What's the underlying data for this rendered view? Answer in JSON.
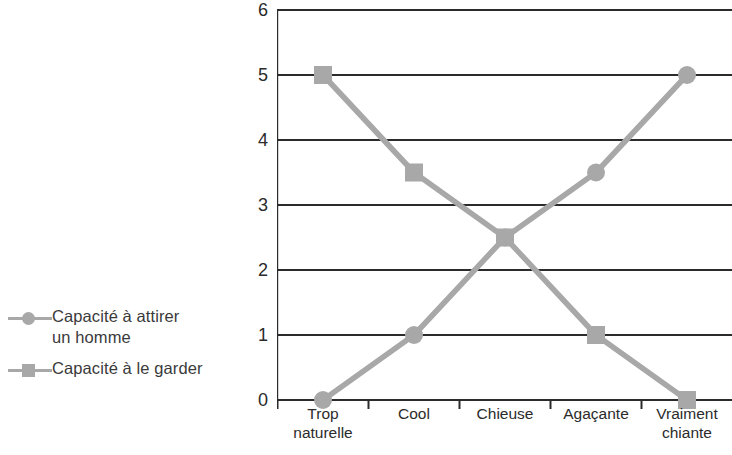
{
  "chart_data": {
    "type": "line",
    "title": "",
    "subtitle": "",
    "xlabel": "",
    "ylabel": "",
    "categories": [
      "Trop\nnaturelle",
      "Cool",
      "Chieuse",
      "Agaçante",
      "Vraiment\nchiante"
    ],
    "ylim": [
      0,
      6
    ],
    "yticks": [
      "0",
      "1",
      "2",
      "3",
      "4",
      "5",
      "6"
    ],
    "grid": true,
    "legend_position": "left",
    "series": [
      {
        "name": "Capacité à attirer\nun homme",
        "marker": "circle",
        "color": "#a8a8a8",
        "values": [
          0,
          1,
          2.5,
          3.5,
          5
        ]
      },
      {
        "name": "Capacité à le garder",
        "marker": "square",
        "color": "#a8a8a8",
        "values": [
          5,
          3.5,
          2.5,
          1,
          0
        ]
      }
    ],
    "axis_color": "#2b2b2b",
    "grid_color": "#2b2b2b",
    "background": "#ffffff"
  }
}
